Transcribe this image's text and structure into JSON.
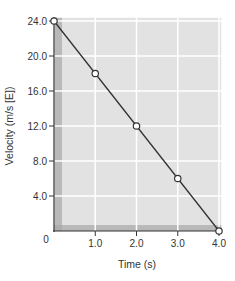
{
  "chart_data": {
    "type": "line",
    "title": "",
    "xlabel": "Time (s)",
    "ylabel": "Velocity (m/s [E])",
    "x": [
      0,
      1.0,
      2.0,
      3.0,
      4.0
    ],
    "series": [
      {
        "name": "velocity",
        "values": [
          24.0,
          18.0,
          12.0,
          6.0,
          0.0
        ]
      }
    ],
    "xlim": [
      0,
      4.0
    ],
    "ylim": [
      0,
      24.0
    ],
    "xticks": [
      "0",
      "1.0",
      "2.0",
      "3.0",
      "4.0"
    ],
    "yticks": [
      "4.0",
      "8.0",
      "12.0",
      "16.0",
      "20.0",
      "24.0"
    ],
    "grid": true,
    "colors": {
      "plot_bg": "#e2e2e2",
      "grid": "#ffffff",
      "line": "#333333",
      "marker_fill": "#ffffff",
      "axis_shadow": "#a8a8a8"
    }
  }
}
